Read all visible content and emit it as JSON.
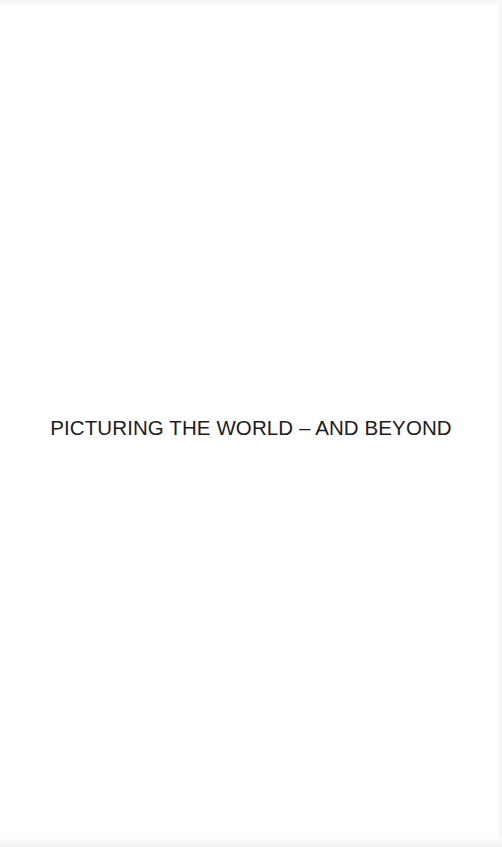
{
  "document": {
    "title": "PICTURING THE WORLD – AND BEYOND"
  }
}
